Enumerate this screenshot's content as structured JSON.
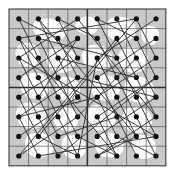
{
  "figure": {
    "title": "",
    "caption": "",
    "type": "grid-graph-diagram",
    "canvas": {
      "width": 173,
      "height": 174,
      "background": "#ffffff"
    },
    "grid": {
      "rows": 8,
      "cols": 8,
      "origin_x": 9.0,
      "origin_y": 9.0,
      "cell_w": 19.6,
      "cell_h": 19.6,
      "line_color": "#555555",
      "line_width": 0.7,
      "outer_border_color": "#3a3a3a",
      "outer_border_width": 1.1,
      "quadrant_divider_color": "#2e2e2e",
      "quadrant_divider_width": 1.5,
      "quadrant_divider_rows": [
        4
      ],
      "quadrant_divider_cols": [
        4
      ]
    },
    "shading": {
      "base_fill": "#c9c9c9",
      "hole_fill": "#ffffff",
      "note": "gray field with white organic blob holes",
      "blobs": [
        "M 34 22 C 44 16 58 18 64 26 C 70 34 62 42 52 42 C 40 42 30 34 34 22 Z",
        "M 78 20 C 86 14 96 16 98 24 C 100 32 92 36 84 34 C 76 32 72 26 78 20 Z",
        "M 112 18 C 124 14 136 20 136 30 C 136 40 124 44 114 40 C 104 36 102 22 112 18 Z",
        "M 146 26 C 156 24 162 32 158 40 C 154 48 144 46 142 38 C 140 32 140 28 146 26 Z",
        "M 20 44 C 30 40 40 46 40 56 C 40 66 28 70 20 64 C 14 58 14 48 20 44 Z",
        "M 52 48 C 64 44 76 50 76 60 C 76 72 62 76 52 70 C 44 64 44 52 52 48 Z",
        "M 88 46 C 100 42 112 48 112 58 C 112 70 98 74 88 68 C 80 62 80 50 88 46 Z",
        "M 124 48 C 136 44 148 50 148 60 C 148 72 134 76 124 70 C 116 64 116 52 124 48 Z",
        "M 26 74 C 38 70 50 76 50 86 C 50 98 36 102 26 96 C 18 90 18 78 26 74 Z",
        "M 60 78 C 70 74 80 80 80 90 C 80 100 68 104 60 98 C 54 92 54 82 60 78 Z",
        "M 96 76 C 108 72 120 78 120 88 C 120 100 106 104 96 98 C 88 92 88 80 96 76 Z",
        "M 130 78 C 142 74 154 80 154 90 C 154 102 140 106 130 100 C 122 94 122 82 130 78 Z",
        "M 22 104 C 34 100 46 106 46 116 C 46 128 32 132 22 126 C 14 120 14 108 22 104 Z",
        "M 58 108 C 68 104 78 110 78 120 C 78 130 66 134 58 128 C 52 122 52 112 58 108 Z",
        "M 92 106 C 104 102 116 108 116 118 C 116 130 102 134 92 128 C 84 122 84 110 92 106 Z",
        "M 128 108 C 140 104 152 110 152 120 C 152 132 138 136 128 130 C 120 124 120 112 128 108 Z",
        "M 30 134 C 42 130 54 136 54 146 C 54 156 42 160 32 156 C 24 152 22 138 30 134 Z",
        "M 66 136 C 76 132 86 138 86 148 C 86 158 74 162 66 156 C 60 150 60 140 66 136 Z",
        "M 100 134 C 112 130 124 136 124 146 C 124 156 112 160 102 156 C 94 152 92 138 100 134 Z",
        "M 136 136 C 146 132 156 138 156 148 C 156 158 144 162 136 156 C 130 150 130 140 136 136 Z"
      ],
      "spiral": {
        "cx": 77,
        "cy": 98,
        "path": "M 80 95 C 76 93 72 96 73 100 C 74 104 79 104 80 101 C 81 98 78 96 76 98",
        "stroke": "#3a3a3a",
        "width": 0.8
      }
    },
    "nodes": {
      "radius": 2.6,
      "fill": "#111111",
      "count": 64,
      "label": "cell-center vertex"
    },
    "edges": {
      "stroke": "#2b2b2b",
      "width": 0.9,
      "count": 64,
      "description": "permutation matching between grid cell centers",
      "pairs": [
        [
          0,
          0,
          2,
          1
        ],
        [
          0,
          1,
          2,
          2
        ],
        [
          0,
          2,
          2,
          3
        ],
        [
          0,
          3,
          2,
          0
        ],
        [
          0,
          4,
          2,
          5
        ],
        [
          0,
          5,
          2,
          6
        ],
        [
          0,
          6,
          2,
          7
        ],
        [
          0,
          7,
          2,
          4
        ],
        [
          1,
          0,
          3,
          1
        ],
        [
          1,
          1,
          3,
          2
        ],
        [
          1,
          2,
          3,
          3
        ],
        [
          1,
          3,
          3,
          0
        ],
        [
          1,
          4,
          3,
          5
        ],
        [
          1,
          5,
          3,
          6
        ],
        [
          1,
          6,
          3,
          7
        ],
        [
          1,
          7,
          3,
          4
        ],
        [
          2,
          0,
          4,
          1
        ],
        [
          2,
          1,
          4,
          2
        ],
        [
          2,
          2,
          4,
          3
        ],
        [
          2,
          3,
          4,
          0
        ],
        [
          2,
          4,
          4,
          5
        ],
        [
          2,
          5,
          4,
          6
        ],
        [
          2,
          6,
          4,
          7
        ],
        [
          2,
          7,
          4,
          4
        ],
        [
          3,
          0,
          5,
          1
        ],
        [
          3,
          1,
          5,
          2
        ],
        [
          3,
          2,
          5,
          3
        ],
        [
          3,
          3,
          5,
          0
        ],
        [
          3,
          4,
          5,
          5
        ],
        [
          3,
          5,
          5,
          6
        ],
        [
          3,
          6,
          5,
          7
        ],
        [
          3,
          7,
          5,
          4
        ],
        [
          4,
          0,
          6,
          1
        ],
        [
          4,
          1,
          6,
          2
        ],
        [
          4,
          2,
          6,
          3
        ],
        [
          4,
          3,
          6,
          0
        ],
        [
          4,
          4,
          6,
          5
        ],
        [
          4,
          5,
          6,
          6
        ],
        [
          4,
          6,
          6,
          7
        ],
        [
          4,
          7,
          6,
          4
        ],
        [
          5,
          0,
          7,
          1
        ],
        [
          5,
          1,
          7,
          2
        ],
        [
          5,
          2,
          7,
          3
        ],
        [
          5,
          3,
          7,
          0
        ],
        [
          5,
          4,
          7,
          5
        ],
        [
          5,
          5,
          7,
          6
        ],
        [
          5,
          6,
          7,
          7
        ],
        [
          5,
          7,
          7,
          4
        ],
        [
          0,
          0,
          1,
          2
        ],
        [
          0,
          2,
          1,
          4
        ],
        [
          0,
          4,
          1,
          6
        ],
        [
          0,
          6,
          1,
          0
        ],
        [
          6,
          1,
          7,
          3
        ],
        [
          6,
          3,
          7,
          5
        ],
        [
          6,
          5,
          7,
          7
        ],
        [
          6,
          7,
          7,
          1
        ],
        [
          1,
          1,
          2,
          5
        ],
        [
          2,
          2,
          3,
          6
        ],
        [
          3,
          3,
          4,
          7
        ],
        [
          4,
          4,
          5,
          0
        ],
        [
          5,
          5,
          6,
          2
        ],
        [
          6,
          6,
          7,
          4
        ],
        [
          1,
          3,
          4,
          1
        ],
        [
          2,
          6,
          5,
          3
        ]
      ]
    },
    "long_chords": {
      "stroke": "#2b2b2b",
      "width": 0.9,
      "pairs": [
        [
          0,
          1,
          6,
          6
        ],
        [
          0,
          6,
          6,
          1
        ],
        [
          1,
          0,
          7,
          5
        ],
        [
          1,
          5,
          7,
          0
        ],
        [
          2,
          0,
          6,
          7
        ],
        [
          3,
          7,
          7,
          2
        ],
        [
          0,
          3,
          5,
          7
        ],
        [
          2,
          4,
          7,
          3
        ]
      ]
    }
  }
}
